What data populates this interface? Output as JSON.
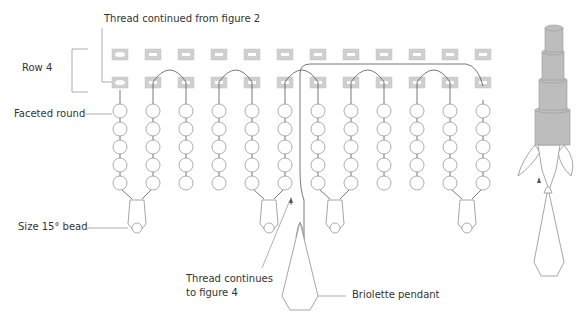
{
  "labels": {
    "thread_from": "Thread continued from figure 2",
    "row": "Row 4",
    "faceted": "Faceted round",
    "size15": "Size 15° bead",
    "thread_to_line1": "Thread continues",
    "thread_to_line2": "to figure 4",
    "briolette": "Briolette pendant"
  },
  "diagram": {
    "columns": 12,
    "column_x_start": 120,
    "column_spacing": 33,
    "rows_of_cylinder_beads": 2,
    "faceted_rounds_per_column": 5,
    "fringe_drops": 4,
    "colors": {
      "cylinder_bead": "#cfcfcf",
      "thread": "#555555",
      "bead_outline": "#8a8a8a",
      "label_text": "#333333"
    }
  }
}
